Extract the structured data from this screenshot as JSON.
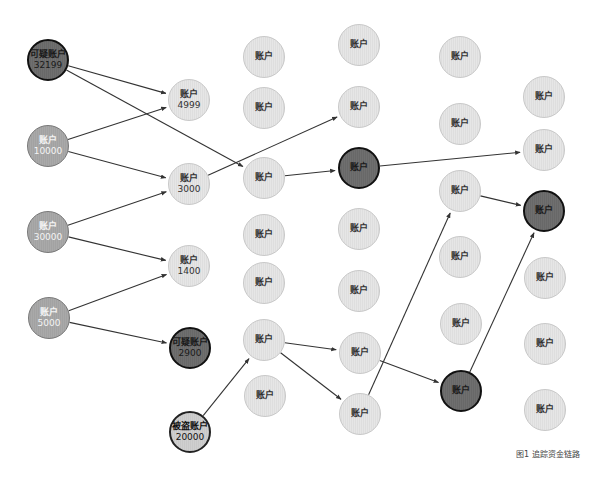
{
  "figure": {
    "caption": "图1 追踪资金链路",
    "colors": {
      "suspicious_fill": "#6d6d6d",
      "source_fill": "#a6a6a6",
      "normal_fill": "#e2e2e2",
      "edge": "#333333"
    }
  },
  "nodes": [
    {
      "id": "c1a",
      "label": "可疑账户",
      "value": "32199",
      "type": "dark",
      "x": 48,
      "y": 60,
      "r": 21
    },
    {
      "id": "c1b",
      "label": "账户",
      "value": "10000",
      "type": "medium",
      "x": 48,
      "y": 146,
      "r": 21
    },
    {
      "id": "c1c",
      "label": "账户",
      "value": "30000",
      "type": "medium",
      "x": 48,
      "y": 232,
      "r": 21
    },
    {
      "id": "c1d",
      "label": "账户",
      "value": "5000",
      "type": "medium",
      "x": 49,
      "y": 318,
      "r": 21
    },
    {
      "id": "c2a",
      "label": "账户",
      "value": "4999",
      "type": "light",
      "x": 189,
      "y": 100,
      "r": 21
    },
    {
      "id": "c2b",
      "label": "账户",
      "value": "3000",
      "type": "light",
      "x": 189,
      "y": 184,
      "r": 21
    },
    {
      "id": "c2c",
      "label": "账户",
      "value": "1400",
      "type": "light",
      "x": 189,
      "y": 266,
      "r": 21
    },
    {
      "id": "c2d",
      "label": "可疑账户",
      "value": "2900",
      "type": "dark",
      "x": 190,
      "y": 348,
      "r": 21
    },
    {
      "id": "c2e",
      "label": "被盗账户",
      "value": "20000",
      "type": "victim",
      "x": 190,
      "y": 432,
      "r": 21
    },
    {
      "id": "c3a",
      "label": "账户",
      "value": "",
      "type": "light",
      "x": 264,
      "y": 57,
      "r": 21
    },
    {
      "id": "c3b",
      "label": "账户",
      "value": "",
      "type": "light",
      "x": 264,
      "y": 108,
      "r": 21
    },
    {
      "id": "c3c",
      "label": "账户",
      "value": "",
      "type": "light",
      "x": 264,
      "y": 178,
      "r": 21
    },
    {
      "id": "c3d",
      "label": "账户",
      "value": "",
      "type": "light",
      "x": 264,
      "y": 235,
      "r": 21
    },
    {
      "id": "c3e",
      "label": "账户",
      "value": "",
      "type": "light",
      "x": 264,
      "y": 283,
      "r": 21
    },
    {
      "id": "c3f",
      "label": "账户",
      "value": "",
      "type": "light",
      "x": 264,
      "y": 340,
      "r": 21
    },
    {
      "id": "c3g",
      "label": "账户",
      "value": "",
      "type": "light",
      "x": 265,
      "y": 396,
      "r": 21
    },
    {
      "id": "c4a",
      "label": "账户",
      "value": "",
      "type": "light",
      "x": 359,
      "y": 45,
      "r": 21
    },
    {
      "id": "c4b",
      "label": "账户",
      "value": "",
      "type": "light",
      "x": 359,
      "y": 107,
      "r": 21
    },
    {
      "id": "c4c",
      "label": "账户",
      "value": "",
      "type": "dark",
      "x": 359,
      "y": 168,
      "r": 21
    },
    {
      "id": "c4d",
      "label": "账户",
      "value": "",
      "type": "light",
      "x": 359,
      "y": 229,
      "r": 21
    },
    {
      "id": "c4e",
      "label": "账户",
      "value": "",
      "type": "light",
      "x": 359,
      "y": 291,
      "r": 21
    },
    {
      "id": "c4f",
      "label": "账户",
      "value": "",
      "type": "light",
      "x": 360,
      "y": 353,
      "r": 21
    },
    {
      "id": "c4g",
      "label": "账户",
      "value": "",
      "type": "light",
      "x": 360,
      "y": 414,
      "r": 21
    },
    {
      "id": "c5a",
      "label": "账户",
      "value": "",
      "type": "light",
      "x": 460,
      "y": 57,
      "r": 21
    },
    {
      "id": "c5b",
      "label": "账户",
      "value": "",
      "type": "light",
      "x": 460,
      "y": 124,
      "r": 21
    },
    {
      "id": "c5c",
      "label": "账户",
      "value": "",
      "type": "light",
      "x": 460,
      "y": 191,
      "r": 21
    },
    {
      "id": "c5d",
      "label": "账户",
      "value": "",
      "type": "light",
      "x": 460,
      "y": 257,
      "r": 21
    },
    {
      "id": "c5e",
      "label": "账户",
      "value": "",
      "type": "light",
      "x": 461,
      "y": 324,
      "r": 21
    },
    {
      "id": "c5f",
      "label": "账户",
      "value": "",
      "type": "dark",
      "x": 461,
      "y": 391,
      "r": 21
    },
    {
      "id": "c6a",
      "label": "账户",
      "value": "",
      "type": "light",
      "x": 544,
      "y": 97,
      "r": 21
    },
    {
      "id": "c6b",
      "label": "账户",
      "value": "",
      "type": "light",
      "x": 544,
      "y": 150,
      "r": 21
    },
    {
      "id": "c6c",
      "label": "账户",
      "value": "",
      "type": "dark",
      "x": 544,
      "y": 211,
      "r": 21
    },
    {
      "id": "c6d",
      "label": "账户",
      "value": "",
      "type": "light",
      "x": 545,
      "y": 278,
      "r": 21
    },
    {
      "id": "c6e",
      "label": "账户",
      "value": "",
      "type": "light",
      "x": 545,
      "y": 344,
      "r": 21
    },
    {
      "id": "c6f",
      "label": "账户",
      "value": "",
      "type": "light",
      "x": 545,
      "y": 410,
      "r": 21
    }
  ],
  "edges": [
    {
      "from": "c1a",
      "to": "c2a"
    },
    {
      "from": "c1a",
      "to": "c3c"
    },
    {
      "from": "c1b",
      "to": "c2a"
    },
    {
      "from": "c1b",
      "to": "c2b"
    },
    {
      "from": "c1c",
      "to": "c2b"
    },
    {
      "from": "c1c",
      "to": "c2c"
    },
    {
      "from": "c1d",
      "to": "c2c"
    },
    {
      "from": "c1d",
      "to": "c2d"
    },
    {
      "from": "c2b",
      "to": "c4b"
    },
    {
      "from": "c2e",
      "to": "c3f"
    },
    {
      "from": "c3c",
      "to": "c4c"
    },
    {
      "from": "c3f",
      "to": "c4f"
    },
    {
      "from": "c3f",
      "to": "c4g"
    },
    {
      "from": "c4c",
      "to": "c6b"
    },
    {
      "from": "c4f",
      "to": "c5f"
    },
    {
      "from": "c4g",
      "to": "c5c"
    },
    {
      "from": "c5c",
      "to": "c6c"
    },
    {
      "from": "c5f",
      "to": "c6c"
    }
  ]
}
